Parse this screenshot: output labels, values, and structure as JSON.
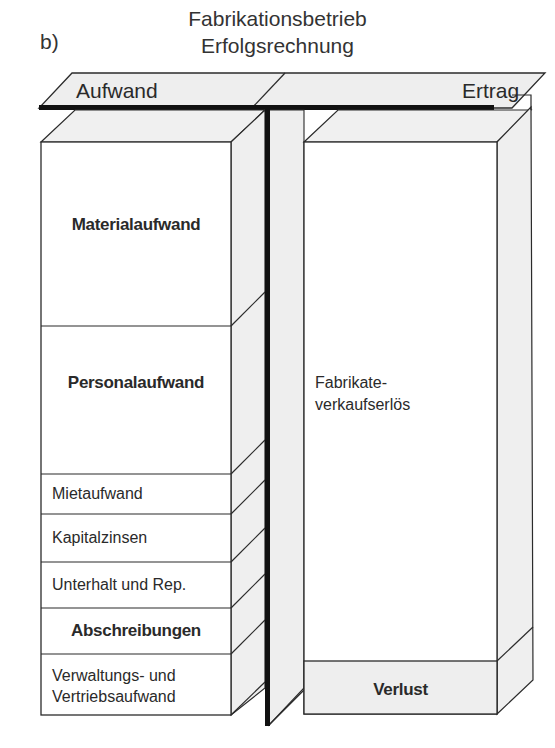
{
  "header": {
    "panel_label": "b)",
    "title_line1": "Fabrikationsbetrieb",
    "title_line2": "Erfolgsrechnung"
  },
  "plate": {
    "left_label": "Aufwand",
    "right_label": "Ertrag"
  },
  "aufwand": {
    "items": [
      {
        "label": "Materialaufwand",
        "bold": true
      },
      {
        "label": "Personalaufwand",
        "bold": true
      },
      {
        "label": "Mietaufwand",
        "bold": false
      },
      {
        "label": "Kapitalzinsen",
        "bold": false
      },
      {
        "label": "Unterhalt und Rep.",
        "bold": false
      },
      {
        "label": "Abschreibungen",
        "bold": true
      },
      {
        "label_line1": "Verwaltungs- und",
        "label_line2": "Vertriebsaufwand",
        "bold": false
      }
    ]
  },
  "ertrag": {
    "items": [
      {
        "label_line1": "Fabrikate-",
        "label_line2": "verkaufserlös",
        "bold": false
      },
      {
        "label": "Verlust",
        "bold": true
      }
    ]
  },
  "colors": {
    "line": "#2b2b2b",
    "face_gray": "#eeeeee",
    "face_white": "#ffffff",
    "bar_black": "#111111"
  }
}
